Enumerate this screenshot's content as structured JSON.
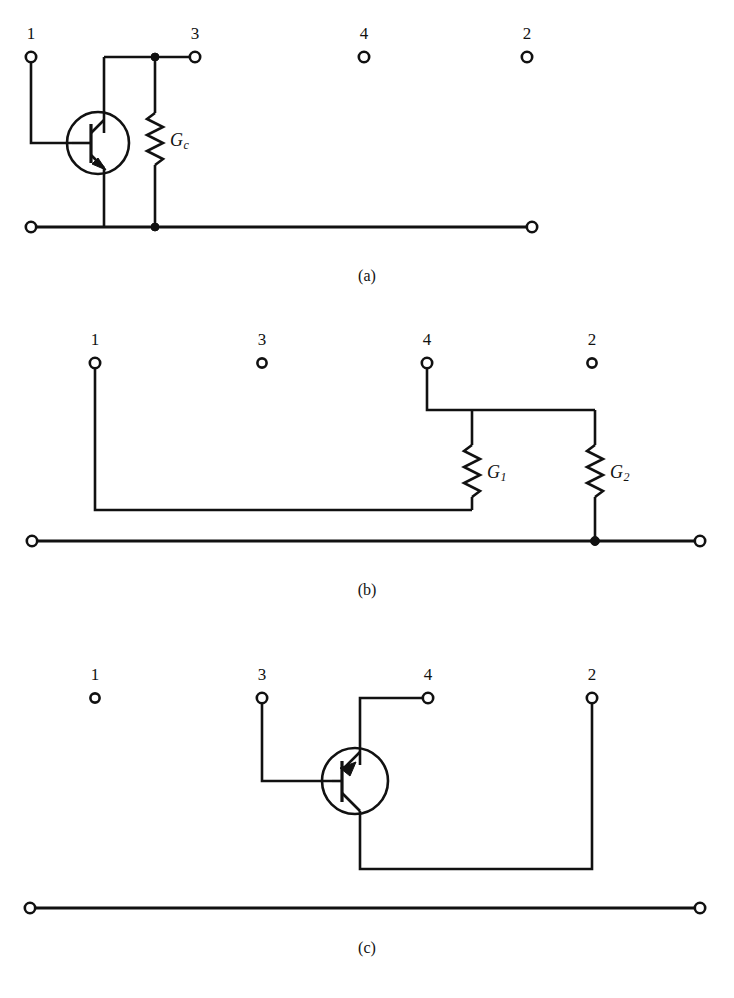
{
  "figure": {
    "type": "circuit-diagram",
    "panels": [
      {
        "id": "a",
        "caption": "(a)",
        "terminals": [
          {
            "label": "1",
            "x": 31,
            "y": 57,
            "connected": true
          },
          {
            "label": "3",
            "x": 195,
            "y": 57,
            "connected": true
          },
          {
            "label": "4",
            "x": 364,
            "y": 57,
            "connected": false
          },
          {
            "label": "2",
            "x": 527,
            "y": 57,
            "connected": false
          },
          {
            "label": "",
            "x": 31,
            "y": 227,
            "connected": true
          },
          {
            "label": "",
            "x": 532,
            "y": 227,
            "connected": true
          }
        ],
        "components": [
          {
            "kind": "transistor",
            "polarity": "NPN",
            "name": "transistor-npn"
          },
          {
            "kind": "resistor",
            "label": "G",
            "sub": "c",
            "name": "resistor-gc"
          }
        ]
      },
      {
        "id": "b",
        "caption": "(b)",
        "terminals": [
          {
            "label": "1",
            "x": 95,
            "y": 363,
            "connected": true
          },
          {
            "label": "3",
            "x": 262,
            "y": 363,
            "connected": false
          },
          {
            "label": "4",
            "x": 427,
            "y": 363,
            "connected": true
          },
          {
            "label": "2",
            "x": 592,
            "y": 363,
            "connected": false
          },
          {
            "label": "",
            "x": 32,
            "y": 541,
            "connected": true
          },
          {
            "label": "",
            "x": 700,
            "y": 541,
            "connected": true
          }
        ],
        "components": [
          {
            "kind": "resistor",
            "label": "G",
            "sub": "1",
            "name": "resistor-g1"
          },
          {
            "kind": "resistor",
            "label": "G",
            "sub": "2",
            "name": "resistor-g2"
          }
        ]
      },
      {
        "id": "c",
        "caption": "(c)",
        "terminals": [
          {
            "label": "1",
            "x": 95,
            "y": 698,
            "connected": false
          },
          {
            "label": "3",
            "x": 262,
            "y": 698,
            "connected": true
          },
          {
            "label": "4",
            "x": 428,
            "y": 698,
            "connected": true
          },
          {
            "label": "2",
            "x": 592,
            "y": 698,
            "connected": true
          },
          {
            "label": "",
            "x": 30,
            "y": 908,
            "connected": true
          },
          {
            "label": "",
            "x": 700,
            "y": 908,
            "connected": true
          }
        ],
        "components": [
          {
            "kind": "transistor",
            "polarity": "PNP",
            "name": "transistor-pnp"
          }
        ]
      }
    ],
    "labels": {
      "gc": "G",
      "gc_sub": "c",
      "g1": "G",
      "g1_sub": "1",
      "g2": "G",
      "g2_sub": "2",
      "num_1": "1",
      "num_2": "2",
      "num_3": "3",
      "num_4": "4",
      "caption_a": "(a)",
      "caption_b": "(b)",
      "caption_c": "(c)"
    },
    "colors": {
      "ink": "#111111",
      "paper": "#ffffff"
    }
  }
}
